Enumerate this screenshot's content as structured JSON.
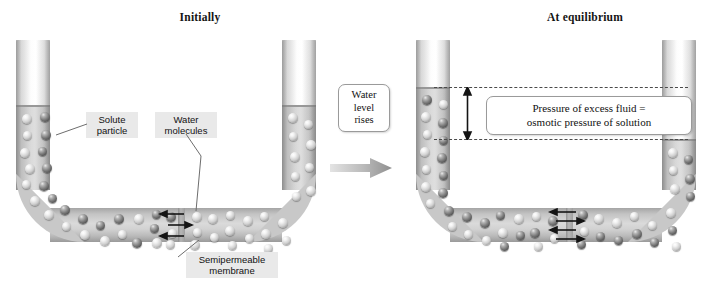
{
  "figure": {
    "type": "osmosis-diagram",
    "panels": [
      {
        "id": "initially",
        "heading": "Initially",
        "labels": [
          {
            "id": "solute-particle",
            "text": "Solute\nparticle"
          },
          {
            "id": "water-molecules",
            "text": "Water\nmolecules"
          },
          {
            "id": "semipermeable-membrane",
            "text": "Semipermeable\nmembrane"
          }
        ],
        "left_arm_contents": "solution",
        "right_arm_contents": "water",
        "levels_equal": true,
        "membrane_arrows": [
          "left",
          "right",
          "left"
        ]
      },
      {
        "id": "at-equilibrium",
        "heading": "At equilibrium",
        "callout": "Pressure of excess fluid =\nosmotic pressure of solution",
        "levels_equal": false,
        "membrane_arrows": [
          "left",
          "right",
          "left",
          "right"
        ]
      }
    ],
    "transition": {
      "caption": "Water\nlevel\nrises",
      "arrow_direction": "right"
    },
    "colors": {
      "label_background": "#e9e9e9",
      "text": "#111111",
      "glass": "#cccccc",
      "liquid": "#d2d2d2",
      "membrane": "#9d9d9d",
      "dashed_line": "#4a4a4a",
      "solute_sphere": "#7b7b7b",
      "water_sphere": "#cfcfcf",
      "arrow": "#1a1a1a"
    }
  }
}
